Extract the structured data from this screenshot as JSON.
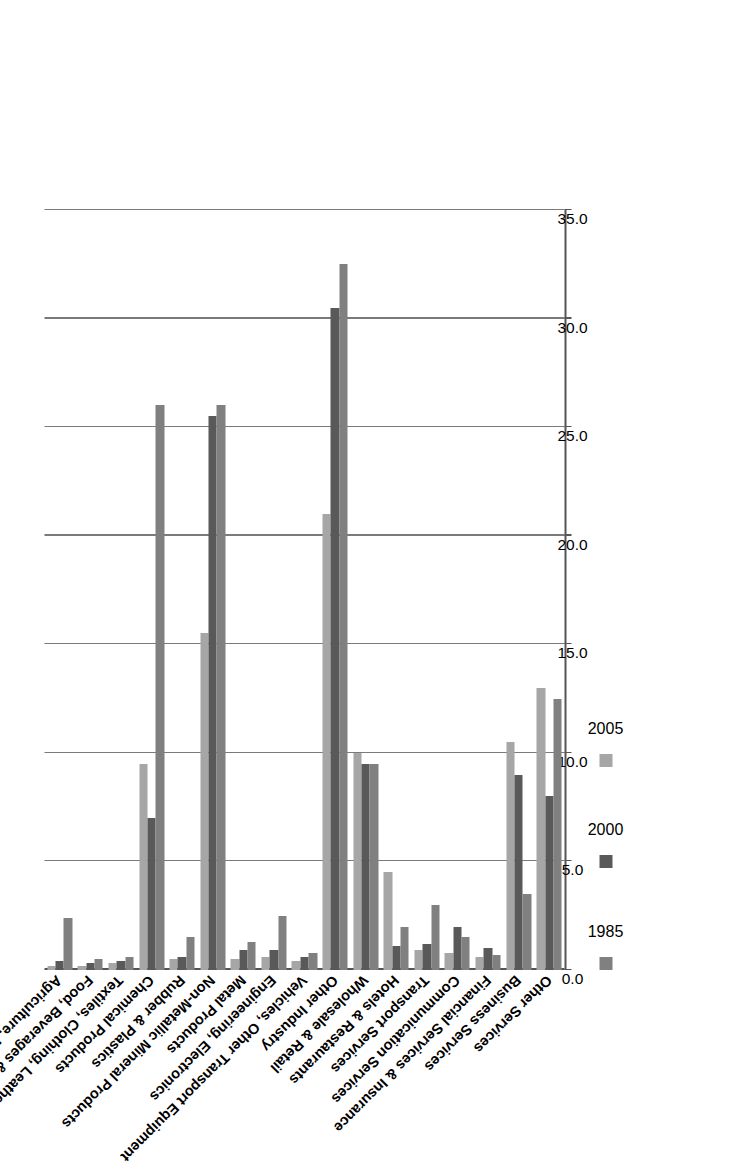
{
  "chart_data": {
    "type": "bar",
    "orientation": "horizontal",
    "title": "",
    "xlabel": "",
    "ylabel": "",
    "xlim": [
      0,
      35
    ],
    "xticks": [
      "0.0",
      "5.0",
      "10.0",
      "15.0",
      "20.0",
      "25.0",
      "30.0",
      "35.0"
    ],
    "tick_step": 5.0,
    "grid": true,
    "legend_position": "bottom",
    "rotated_degrees": -90,
    "categories": [
      "Agriculture, Forestry & Fishing",
      "Food, Beverages & Tobacco",
      "Textiles, Clothing, Leather Products",
      "Chemical Products",
      "Rubber & Plastics",
      "Non-Metallic Mineral Products",
      "Metal Products",
      "Engineering, Electronics",
      "Vehicles, Other Transport Equipment",
      "Other Industry",
      "Wholesale & Retail",
      "Hotels & Restaurants",
      "Transport Services",
      "Communication Services",
      "Financial Services & Insurance",
      "Business Services",
      "Other Services"
    ],
    "series": [
      {
        "name": "1985",
        "color": "#808080",
        "values": [
          2.4,
          0.5,
          0.6,
          26.0,
          1.5,
          26.0,
          1.3,
          2.5,
          0.8,
          32.5,
          9.5,
          2.0,
          3.0,
          1.5,
          0.7,
          3.5,
          12.5
        ]
      },
      {
        "name": "2000",
        "color": "#595959",
        "values": [
          0.4,
          0.3,
          0.4,
          7.0,
          0.6,
          25.5,
          0.9,
          0.9,
          0.6,
          30.5,
          9.5,
          1.1,
          1.2,
          2.0,
          1.0,
          9.0,
          8.0
        ]
      },
      {
        "name": "2005",
        "color": "#a6a6a6",
        "values": [
          0.2,
          0.2,
          0.3,
          9.5,
          0.5,
          15.5,
          0.5,
          0.6,
          0.4,
          21.0,
          10.0,
          4.5,
          0.9,
          0.8,
          0.6,
          10.5,
          13.0
        ]
      }
    ]
  },
  "legend": {
    "items": [
      {
        "label": "1985",
        "swatch": "legend-swatch-1985"
      },
      {
        "label": "2000",
        "swatch": "legend-swatch-2000"
      },
      {
        "label": "2005",
        "swatch": "legend-swatch-2005"
      }
    ]
  }
}
